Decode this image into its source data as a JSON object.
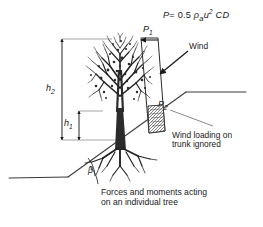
{
  "figure": {
    "title": "Forces and moments acting on an individual tree",
    "formula": {
      "lead": "P",
      "equals": "=",
      "coefficient": "0.5",
      "density_symbol": "ρ",
      "density_subscript": "a",
      "velocity_symbol": "u",
      "velocity_exponent": "2",
      "drag_symbol": "CD",
      "full_text": "P = 0.5 ρₐu² CD"
    },
    "labels": {
      "p1": {
        "base": "P",
        "sub": "1"
      },
      "p2": {
        "base": "P",
        "sub": "2"
      },
      "h1": {
        "base": "h",
        "sub": "1"
      },
      "h2": {
        "base": "h",
        "sub": "2"
      },
      "beta": "β",
      "wind": "Wind",
      "note_line1": "Wind loading on",
      "note_line2": "trunk ignored",
      "caption_line1": "Forces and moments acting",
      "caption_line2": "on an individual tree"
    },
    "icons": {
      "wind_arrow": "arrow-down-left-icon",
      "p1_arrow": "arrow-left-icon",
      "tree": "tree-icon",
      "roots": "roots-icon",
      "ground": "ground-slope-icon",
      "force_profile": "wind-force-profile-icon",
      "angle_arc": "angle-arc-icon",
      "dimension_h1": "dimension-line-icon",
      "dimension_h2": "dimension-line-icon",
      "leader_note": "leader-line-icon"
    },
    "colors": {
      "ink": "#1a1a1a",
      "line": "#2b2b2b",
      "thin_line": "#555555",
      "shade": "#8a8a8a",
      "background": "#ffffff"
    }
  }
}
